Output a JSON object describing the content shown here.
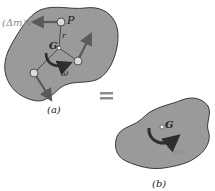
{
  "colors": {
    "body_fill": "#9a9a9a",
    "body_stroke": "#3a3a3a",
    "vector": "#5a5a5a",
    "moment_arrow": "#2e2e2e",
    "label": "#222222",
    "faded_label": "#8a8a8a",
    "equals": "#8c8c8c"
  },
  "figure_a": {
    "caption": "(a)",
    "point_p_label": "P",
    "radius_label": "r",
    "center_label": "G",
    "angular_velocity_label": "ω",
    "momentum_label": "(Δm)v"
  },
  "equals_sign": "=",
  "figure_b": {
    "caption": "(b)",
    "center_label": "G",
    "angular_momentum_label": "Iω"
  }
}
